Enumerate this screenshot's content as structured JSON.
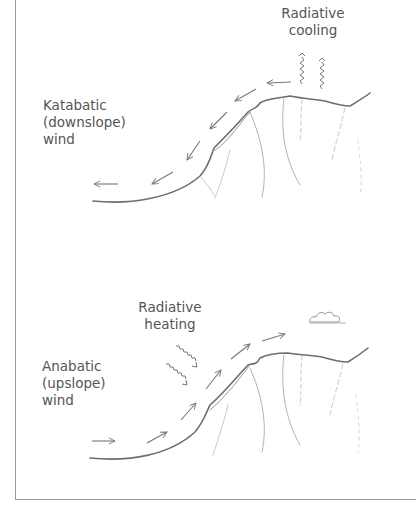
{
  "diagram": {
    "top_panel": {
      "title": "Katabatic wind",
      "wind_label": [
        "Katabatic",
        "(downslope)",
        "wind"
      ],
      "process_label": [
        "Radiative",
        "cooling"
      ]
    },
    "bottom_panel": {
      "title": "Anabatic wind",
      "wind_label": [
        "Anabatic",
        "(upslope)",
        "wind"
      ],
      "process_label": [
        "Radiative",
        "heating"
      ]
    },
    "colors": {
      "line": "#6e6e6e",
      "text": "#555555",
      "border": "#9a9a9a"
    }
  }
}
